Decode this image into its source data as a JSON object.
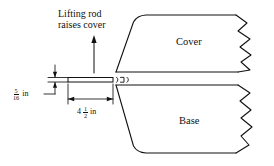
{
  "figure": {
    "type": "engineering-cross-section",
    "background_color": "#ffffff",
    "line_color": "#111111"
  },
  "annotations": {
    "note": {
      "line1": "Lifting rod",
      "line2": "raises cover"
    },
    "cover_label": "Cover",
    "base_label": "Base"
  },
  "dimensions": [
    {
      "name": "thickness",
      "whole": "",
      "numerator": "5",
      "denominator": "16",
      "unit": "in",
      "orientation": "vertical"
    },
    {
      "name": "length",
      "whole": "4",
      "numerator": "1",
      "denominator": "2",
      "unit": "in",
      "orientation": "horizontal"
    }
  ],
  "icons": {
    "up_arrow": "lifting-direction-arrow",
    "break_line": "zigzag-break-line",
    "seal": "o-ring-seal-symbol"
  }
}
